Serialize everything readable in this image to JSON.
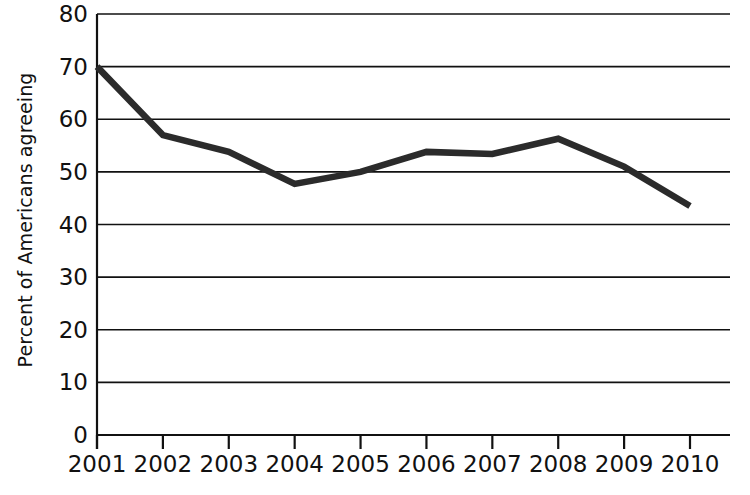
{
  "chart_data": {
    "type": "line",
    "title": "",
    "xlabel": "",
    "ylabel": "Percent of Americans agreeing",
    "categories": [
      "2001",
      "2002",
      "2003",
      "2004",
      "2005",
      "2006",
      "2007",
      "2008",
      "2009",
      "2010"
    ],
    "values": [
      70,
      57,
      53.8,
      47.7,
      50,
      53.8,
      53.4,
      56.3,
      51,
      43.5
    ],
    "series": [
      {
        "name": "Percent of Americans agreeing",
        "values": [
          70,
          57,
          53.8,
          47.7,
          50,
          53.8,
          53.4,
          56.3,
          51,
          43.5
        ]
      }
    ],
    "ylim": [
      0,
      80
    ],
    "yticks": [
      0,
      10,
      20,
      30,
      40,
      50,
      60,
      70,
      80
    ],
    "ytick_labels": [
      "0",
      "10",
      "20",
      "30",
      "40",
      "50",
      "60",
      "70",
      "80"
    ],
    "grid": "horizontal",
    "legend": "none",
    "line_color": "#2b2b2b",
    "axis_color": "#111111",
    "grid_color": "#111111",
    "background": "#ffffff"
  }
}
